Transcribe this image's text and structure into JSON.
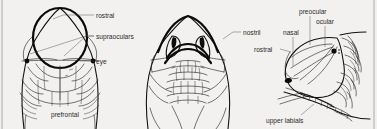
{
  "figure": {
    "background_color": "#f2f1ef",
    "ink_color": "#111111",
    "label_color": "#2b2b2b",
    "panel_count": 3
  },
  "panels": [
    {
      "id": "dorsal-view",
      "name": "Dorsal view of snake head",
      "position": "left",
      "labels": [
        {
          "key": "rostral",
          "text": "rostral",
          "text_x": 96,
          "text_y": 17,
          "anchor": "start",
          "leader": "M94,15 L63,15 L53,19"
        },
        {
          "key": "supraoculars",
          "text": "supraoculars",
          "text_x": 96,
          "text_y": 37,
          "anchor": "start",
          "leader": "M94,35 L84,35 L63,55 M94,35 L84,35 L27,53"
        },
        {
          "key": "eye",
          "text": "eye",
          "text_x": 96,
          "text_y": 63,
          "anchor": "start",
          "leader": "M94,61 L78,61"
        },
        {
          "key": "prefrontal",
          "text": "prefrontal",
          "text_x": 51,
          "text_y": 115,
          "anchor": "start",
          "leader": "M60,106 L60,66"
        }
      ]
    },
    {
      "id": "anterior-view",
      "name": "Anterior (frontal) view of snake head",
      "position": "center",
      "labels": [
        {
          "key": "nostril",
          "text": "nostril",
          "text_x": 243,
          "text_y": 34,
          "anchor": "start",
          "leader": "M241,32 L232,32 L224,38"
        }
      ]
    },
    {
      "id": "lateral-view",
      "name": "Lateral (side) view of snake head",
      "position": "right",
      "labels": [
        {
          "key": "preocular",
          "text": "preocular",
          "text_x": 299,
          "text_y": 12,
          "anchor": "start",
          "leader": "M309,15 L309,45"
        },
        {
          "key": "ocular",
          "text": "ocular",
          "text_x": 316,
          "text_y": 22,
          "anchor": "start",
          "leader": "M324,25 L324,48"
        },
        {
          "key": "nasal",
          "text": "nasal",
          "text_x": 283,
          "text_y": 33,
          "anchor": "start",
          "leader": "M292,36 L292,65"
        },
        {
          "key": "rostral",
          "text": "rostral",
          "text_x": 256,
          "text_y": 51,
          "anchor": "start",
          "leader": "M278,49 L290,52"
        },
        {
          "key": "upper labials",
          "text": "upper labials",
          "text_x": 268,
          "text_y": 121,
          "anchor": "start",
          "leader": "M300,116 L313,104"
        }
      ]
    }
  ]
}
